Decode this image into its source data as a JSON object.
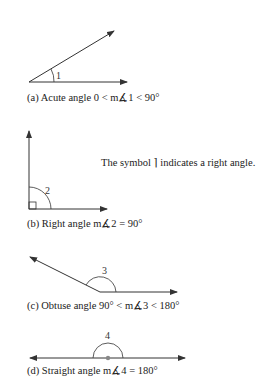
{
  "figures": [
    {
      "id": "a",
      "angle_label": "1",
      "caption": "(a) Acute angle  0 < m∡1 < 90°"
    },
    {
      "id": "b",
      "angle_label": "2",
      "caption": "(b) Right angle  m∡2 = 90°",
      "note": "The symbol ⌉ indicates a right angle."
    },
    {
      "id": "c",
      "angle_label": "3",
      "caption": "(c) Obtuse angle  90° < m∡3 < 180°"
    },
    {
      "id": "d",
      "angle_label": "4",
      "caption": "(d) Straight angle  m∡4 = 180°"
    }
  ],
  "colors": {
    "line": "#333333",
    "vertex_dot": "#888888"
  }
}
